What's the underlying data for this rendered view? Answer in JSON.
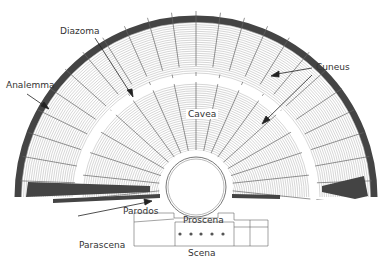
{
  "diagram": {
    "labels": {
      "diazoma": "Diazoma",
      "analemma": "Analemma",
      "cuneus": "Cuneus",
      "cavea": "Cavea",
      "parodos": "Parodos",
      "proscena": "Proscena",
      "parascena": "Parascena",
      "scena": "Scena"
    },
    "colors": {
      "line": "#555555",
      "analemma": "#444444",
      "background": "#ffffff"
    }
  }
}
